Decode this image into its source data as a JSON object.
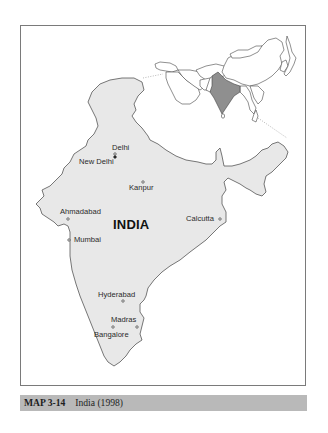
{
  "map": {
    "country_label": "INDIA",
    "colors": {
      "country_fill": "#e8e8e8",
      "inset_highlight": "#8f8f8f",
      "border": "#555555",
      "frame": "#7a7a7a",
      "caption_bg": "#b9b9b9"
    },
    "cities": [
      {
        "name": "Delhi",
        "x": 115,
        "y": 152
      },
      {
        "name": "New Delhi",
        "x": 117,
        "y": 157
      },
      {
        "name": "Kanpur",
        "x": 143,
        "y": 182
      },
      {
        "name": "Ahmadabad",
        "x": 68,
        "y": 219
      },
      {
        "name": "Mumbai",
        "x": 69,
        "y": 240
      },
      {
        "name": "Calcutta",
        "x": 220,
        "y": 219
      },
      {
        "name": "Hyderabad",
        "x": 123,
        "y": 301
      },
      {
        "name": "Madras",
        "x": 137,
        "y": 327
      },
      {
        "name": "Bangalore",
        "x": 113,
        "y": 327
      }
    ],
    "inset": {
      "description": "Locator map of Asia with India highlighted"
    }
  },
  "caption": {
    "number": "MAP 3-14",
    "title": "India (1998)"
  }
}
